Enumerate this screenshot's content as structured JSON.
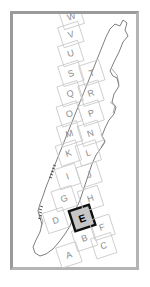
{
  "figure": {
    "frame_color": "#9a9a9a",
    "background_color": "#ffffff",
    "grid_line_color": "#c9c9c9",
    "grid_label_color": "#8d8d8d",
    "outline_color": "#6f6f6f",
    "selected_cell": "E",
    "selected_fill_color": "#c6c6c6",
    "selected_border_color": "#111111",
    "grid_rotation_degrees": -18
  },
  "grid": {
    "cells": [
      {
        "label": "A",
        "cx": 22,
        "cy": 233,
        "selected": false
      },
      {
        "label": "B",
        "cx": 42,
        "cy": 222,
        "selected": false
      },
      {
        "label": "C",
        "cx": 58,
        "cy": 235,
        "selected": false
      },
      {
        "label": "D",
        "cx": 20,
        "cy": 196,
        "selected": false
      },
      {
        "label": "E",
        "cx": 46,
        "cy": 202,
        "selected": true
      },
      {
        "label": "F",
        "cx": 62,
        "cy": 217,
        "selected": false
      },
      {
        "label": "G",
        "cx": 35,
        "cy": 178,
        "selected": false
      },
      {
        "label": "H",
        "cx": 60,
        "cy": 186,
        "selected": false
      },
      {
        "label": "I",
        "cx": 45,
        "cy": 158,
        "selected": false
      },
      {
        "label": "J",
        "cx": 66,
        "cy": 163,
        "selected": false
      },
      {
        "label": "K",
        "cx": 53,
        "cy": 136,
        "selected": false
      },
      {
        "label": "L",
        "cx": 72,
        "cy": 142,
        "selected": false
      },
      {
        "label": "M",
        "cx": 60,
        "cy": 118,
        "selected": false
      },
      {
        "label": "N",
        "cx": 80,
        "cy": 124,
        "selected": false
      },
      {
        "label": "O",
        "cx": 66,
        "cy": 99,
        "selected": false
      },
      {
        "label": "P",
        "cx": 87,
        "cy": 105,
        "selected": false
      },
      {
        "label": "Q",
        "cx": 73,
        "cy": 80,
        "selected": false
      },
      {
        "label": "R",
        "cx": 93,
        "cy": 86,
        "selected": false
      },
      {
        "label": "S",
        "cx": 80,
        "cy": 61,
        "selected": false
      },
      {
        "label": "T",
        "cx": 100,
        "cy": 67,
        "selected": false
      },
      {
        "label": "U",
        "cx": 86,
        "cy": 42,
        "selected": false
      },
      {
        "label": "V",
        "cx": 92,
        "cy": 24,
        "selected": false
      },
      {
        "label": "W",
        "cx": 98,
        "cy": 7,
        "selected": false
      }
    ],
    "cell_width": 21,
    "cell_height": 21
  }
}
